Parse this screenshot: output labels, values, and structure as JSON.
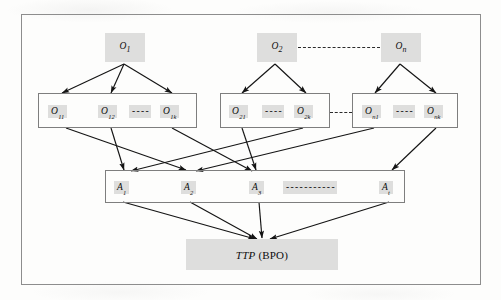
{
  "figure": {
    "frame": {
      "border_color": "#8d8d8d"
    },
    "node_fill": "#dededd",
    "edge_color": "#1a1a1a"
  },
  "levels": {
    "objectives": {
      "name": "top-level-objectives",
      "nodes": [
        {
          "id": "O1",
          "base": "O",
          "sub": "1"
        },
        {
          "id": "O2",
          "base": "O",
          "sub": "2"
        },
        {
          "id": "On",
          "base": "O",
          "sub": "n"
        }
      ],
      "dashed_link": {
        "from": "O2",
        "to": "On",
        "style": "dashed"
      }
    },
    "sub_objectives": {
      "name": "sub-objective-groups",
      "groups": [
        {
          "id": "group-1",
          "parent": "O1",
          "items": [
            {
              "id": "O11",
              "base": "O",
              "sub": "11"
            },
            {
              "id": "O12",
              "base": "O",
              "sub": "12"
            },
            {
              "id": "O1k",
              "base": "O",
              "sub": "1k"
            }
          ],
          "ellipsis": "- - - -"
        },
        {
          "id": "group-2",
          "parent": "O2",
          "items": [
            {
              "id": "O21",
              "base": "O",
              "sub": "21"
            },
            {
              "id": "O2k",
              "base": "O",
              "sub": "2k"
            }
          ],
          "ellipsis": "- - - -"
        },
        {
          "id": "group-n",
          "parent": "On",
          "items": [
            {
              "id": "On1",
              "base": "O",
              "sub": "n1"
            },
            {
              "id": "Onk",
              "base": "O",
              "sub": "nk"
            }
          ],
          "ellipsis": "- - - -"
        }
      ],
      "inter_group_dashes": [
        {
          "from": "group-2",
          "to": "group-n",
          "style": "dashed"
        }
      ]
    },
    "activities": {
      "name": "activity-row",
      "items": [
        {
          "id": "A1",
          "base": "A",
          "sub": "1"
        },
        {
          "id": "A2",
          "base": "A",
          "sub": "2"
        },
        {
          "id": "A3",
          "base": "A",
          "sub": "3"
        },
        {
          "id": "At",
          "base": "A",
          "sub": "t"
        }
      ],
      "ellipsis": "- - - - - - - - - - -"
    },
    "target": {
      "name": "ttp-node",
      "italic_part": "TTP",
      "normal_part": "(BPO)"
    }
  },
  "chart_data": {
    "type": "diagram",
    "nodes": [
      {
        "id": "O1",
        "label": "O1",
        "level": 0
      },
      {
        "id": "O2",
        "label": "O2",
        "level": 0
      },
      {
        "id": "On",
        "label": "On",
        "level": 0
      },
      {
        "id": "O11",
        "label": "O11",
        "level": 1
      },
      {
        "id": "O12",
        "label": "O12",
        "level": 1
      },
      {
        "id": "O1k",
        "label": "O1k",
        "level": 1
      },
      {
        "id": "O21",
        "label": "O21",
        "level": 1
      },
      {
        "id": "O2k",
        "label": "O2k",
        "level": 1
      },
      {
        "id": "On1",
        "label": "On1",
        "level": 1
      },
      {
        "id": "Onk",
        "label": "Onk",
        "level": 1
      },
      {
        "id": "A1",
        "label": "A1",
        "level": 2
      },
      {
        "id": "A2",
        "label": "A2",
        "level": 2
      },
      {
        "id": "A3",
        "label": "A3",
        "level": 2
      },
      {
        "id": "At",
        "label": "At",
        "level": 2
      },
      {
        "id": "TTP",
        "label": "TTP (BPO)",
        "level": 3
      }
    ],
    "edges": [
      {
        "from": "O1",
        "to": "O11",
        "style": "arrow"
      },
      {
        "from": "O1",
        "to": "O12",
        "style": "arrow"
      },
      {
        "from": "O1",
        "to": "O1k",
        "style": "arrow"
      },
      {
        "from": "O2",
        "to": "O21",
        "style": "arrow"
      },
      {
        "from": "O2",
        "to": "O2k",
        "style": "arrow"
      },
      {
        "from": "On",
        "to": "On1",
        "style": "arrow"
      },
      {
        "from": "On",
        "to": "Onk",
        "style": "arrow"
      },
      {
        "from": "O2",
        "to": "On",
        "style": "dashed"
      },
      {
        "from": "O11",
        "to": "A2",
        "style": "arrow"
      },
      {
        "from": "O12",
        "to": "A1",
        "style": "arrow"
      },
      {
        "from": "O1k",
        "to": "A3",
        "style": "arrow"
      },
      {
        "from": "O21",
        "to": "A3",
        "style": "arrow"
      },
      {
        "from": "O2k",
        "to": "A1",
        "style": "arrow"
      },
      {
        "from": "On1",
        "to": "At",
        "style": "arrow"
      },
      {
        "from": "Onk",
        "to": "A2",
        "style": "arrow"
      },
      {
        "from": "A1",
        "to": "TTP",
        "style": "arrow"
      },
      {
        "from": "A2",
        "to": "TTP",
        "style": "arrow"
      },
      {
        "from": "A3",
        "to": "TTP",
        "style": "arrow"
      },
      {
        "from": "At",
        "to": "TTP",
        "style": "arrow"
      }
    ]
  }
}
